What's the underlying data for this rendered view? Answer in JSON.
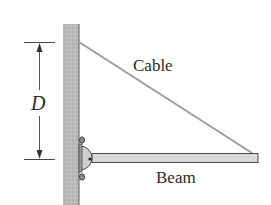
{
  "diagram": {
    "type": "statics-figure",
    "labels": {
      "cable": "Cable",
      "beam": "Beam",
      "dimension": "D"
    },
    "elements": {
      "wall": {
        "orientation": "vertical",
        "color": "#b5b5b5"
      },
      "cable": {
        "from": "wall-top-attachment",
        "to": "beam-end",
        "color": "#9a9a9a"
      },
      "beam": {
        "orientation": "horizontal",
        "support": "pin-bracket",
        "color": "#d4d4d4"
      },
      "dimension": {
        "symbol": "D",
        "spans": "cable attachment to beam pivot",
        "arrows": "both-ends"
      }
    },
    "colors": {
      "wall_fill": "#b8b8b8",
      "outline": "#4a4a4a",
      "cable": "#9e9e9e",
      "beam_fill": "#d8d8d8",
      "text": "#2b2b2b"
    }
  }
}
